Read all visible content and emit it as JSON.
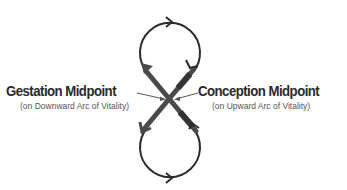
{
  "diagram": {
    "type": "figure-eight cycle",
    "loops": [
      {
        "name": "upper-loop",
        "direction": "clockwise"
      },
      {
        "name": "lower-loop",
        "direction": "counterclockwise"
      }
    ],
    "colors": {
      "loop_stroke": "#2b2b2b",
      "cross_stroke": "#555555",
      "text": "#2a2a2a",
      "subtext": "#555555"
    }
  },
  "labels": {
    "left": {
      "title": "Gestation Midpoint",
      "subtitle": "(on Downward Arc of Vitality)"
    },
    "right": {
      "title": "Conception Midpoint",
      "subtitle": "(on Upward Arc of Vitality)"
    }
  }
}
